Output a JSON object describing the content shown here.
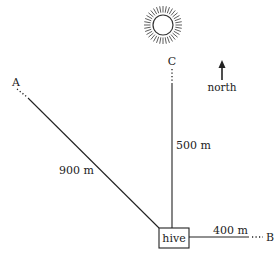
{
  "diagram": {
    "title": "",
    "colors": {
      "ink": "#222222",
      "background": "#ffffff"
    },
    "hive": {
      "label": "hive"
    },
    "locations": {
      "A": {
        "label": "A",
        "distance_label": "900 m",
        "direction": "north-west"
      },
      "B": {
        "label": "B",
        "distance_label": "400 m",
        "direction": "east"
      },
      "C": {
        "label": "C",
        "distance_label": "500 m",
        "direction": "north"
      }
    },
    "compass": {
      "label": "north",
      "icon": "north-arrow-icon"
    },
    "sun": {
      "icon": "sun-icon"
    }
  }
}
